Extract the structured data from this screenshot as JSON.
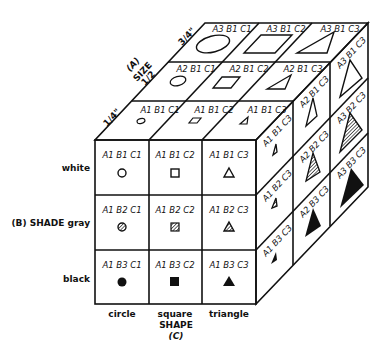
{
  "factors": {
    "size": {
      "label": "SIZE",
      "code": "(A)",
      "levels": [
        "1/4\"",
        "1/2",
        "3/4\""
      ]
    },
    "shade": {
      "label": "SHADE",
      "code": "(B)",
      "levels": [
        "white",
        "gray",
        "black"
      ],
      "axis_label": "(B) SHADE gray"
    },
    "shape": {
      "label": "SHAPE",
      "code": "(C)",
      "levels": [
        "circle",
        "square",
        "triangle"
      ]
    }
  },
  "front_face": {
    "rows": [
      [
        "A1 B1 C1",
        "A1 B1 C2",
        "A1 B1 C3"
      ],
      [
        "A1 B2 C1",
        "A1 B2 C2",
        "A1 B2 C3"
      ],
      [
        "A1 B3 C1",
        "A1 B3 C2",
        "A1 B3 C3"
      ]
    ]
  },
  "top_face": {
    "rows_front_to_back": [
      [
        "A1 B1 C1",
        "A1 B1 C2",
        "A1 B1 C3"
      ],
      [
        "A2 B1 C1",
        "A2 B1 C2",
        "A2 B1 C3"
      ],
      [
        "A3 B1 C1",
        "A3 B1 C2",
        "A3 B1 C3"
      ]
    ]
  },
  "right_face": {
    "columns_front_to_back": [
      [
        "A1 B1 C3",
        "A1 B2 C3",
        "A1 B3 C3"
      ],
      [
        "A2 B1 C3",
        "A2 B2 C3",
        "A2 B3 C3"
      ],
      [
        "A3 B1 C3",
        "A3 B2 C3",
        "A3 B3 C3"
      ]
    ]
  },
  "labels": {
    "white": "white",
    "shade_gray": "(B) SHADE gray",
    "black": "black",
    "circle": "circle",
    "square": "square",
    "triangle": "triangle",
    "shape": "SHAPE",
    "shape_code": "(C)",
    "size_code": "(A)",
    "size": "SIZE",
    "quarter": "1/4\"",
    "half": "1/2",
    "three_quarter": "3/4\""
  }
}
